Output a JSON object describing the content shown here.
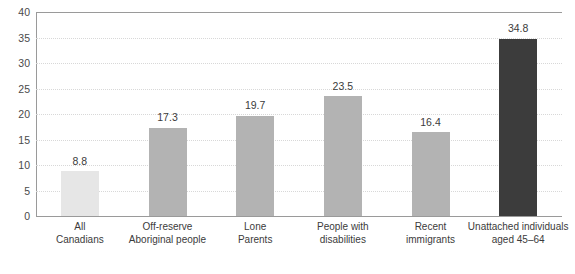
{
  "chart_data": {
    "type": "bar",
    "title": "",
    "subtitle": "",
    "xlabel": "",
    "ylabel": "",
    "ylim": [
      0,
      40
    ],
    "ytick_step": 5,
    "yticks": [
      "40",
      "35",
      "30",
      "25",
      "20",
      "15",
      "10",
      "5",
      "0"
    ],
    "grid": true,
    "legend": "none",
    "categories": [
      {
        "line1": "All",
        "line2": "Canadians"
      },
      {
        "line1": "Off-reserve",
        "line2": "Aboriginal people"
      },
      {
        "line1": "Lone",
        "line2": "Parents"
      },
      {
        "line1": "People with",
        "line2": "disabilities"
      },
      {
        "line1": "Recent",
        "line2": "immigrants"
      },
      {
        "line1": "Unattached individuals",
        "line2": "aged 45–64"
      }
    ],
    "values": [
      8.8,
      17.3,
      19.7,
      23.5,
      16.4,
      34.8
    ],
    "value_labels": [
      "8.8",
      "17.3",
      "19.7",
      "23.5",
      "16.4",
      "34.8"
    ],
    "bar_colors": [
      "#e6e6e6",
      "#b3b3b3",
      "#b3b3b3",
      "#b3b3b3",
      "#b3b3b3",
      "#3c3c3c"
    ]
  },
  "colors": {
    "axis": "#9a9a9a",
    "grid": "#d8d8d8",
    "text": "#3b3b3b",
    "background": "#ffffff",
    "bar_light": "#e6e6e6",
    "bar_medium": "#b3b3b3",
    "bar_dark": "#3c3c3c"
  }
}
